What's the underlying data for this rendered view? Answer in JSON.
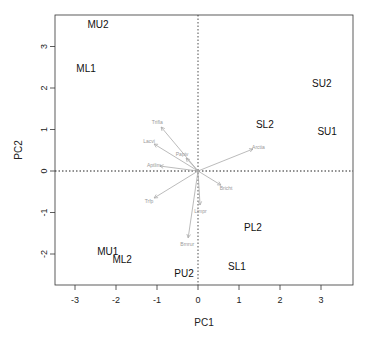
{
  "chart_data": {
    "type": "scatter",
    "subtype": "pca-biplot",
    "title": "",
    "xlabel": "PC1",
    "ylabel": "PC2",
    "xlim": [
      -3.5,
      3.8
    ],
    "ylim": [
      -2.8,
      3.7
    ],
    "x_ticks": [
      "-3",
      "-2",
      "-1",
      "0",
      "1",
      "2",
      "3"
    ],
    "y_ticks": [
      "-2",
      "-1",
      "0",
      "1",
      "2",
      "3"
    ],
    "grid": false,
    "reference_lines": {
      "x": 0,
      "y": 0,
      "style": "dotted"
    },
    "points": [
      {
        "label": "MU2",
        "x": -2.44,
        "y": 3.52
      },
      {
        "label": "ML1",
        "x": -2.73,
        "y": 2.46
      },
      {
        "label": "SU2",
        "x": 3.02,
        "y": 2.12
      },
      {
        "label": "SL2",
        "x": 1.63,
        "y": 1.11
      },
      {
        "label": "SU1",
        "x": 3.15,
        "y": 0.96
      },
      {
        "label": "PL2",
        "x": 1.34,
        "y": -1.35
      },
      {
        "label": "MU1",
        "x": -2.2,
        "y": -1.95
      },
      {
        "label": "ML2",
        "x": -1.85,
        "y": -2.14
      },
      {
        "label": "SL1",
        "x": 0.95,
        "y": -2.31
      },
      {
        "label": "PU2",
        "x": -0.34,
        "y": -2.48
      }
    ],
    "loadings": [
      {
        "label": "Trifla",
        "x": -0.9,
        "y": 1.06
      },
      {
        "label": "Lacvi",
        "x": -1.07,
        "y": 0.65
      },
      {
        "label": "Papiv",
        "x": -0.29,
        "y": 0.31
      },
      {
        "label": "Aptlim",
        "x": -0.93,
        "y": 0.12
      },
      {
        "label": "Arctia",
        "x": 1.34,
        "y": 0.53
      },
      {
        "label": "Bricht",
        "x": 0.56,
        "y": -0.34
      },
      {
        "label": "Trfp",
        "x": -1.07,
        "y": -0.65
      },
      {
        "label": "Limpr",
        "x": 0.05,
        "y": -0.82
      },
      {
        "label": "Brnrur",
        "x": -0.24,
        "y": -1.61
      }
    ]
  }
}
